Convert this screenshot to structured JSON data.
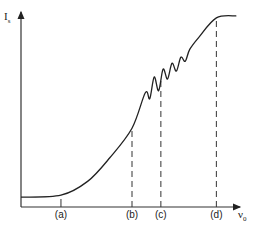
{
  "chart_data": {
    "type": "line",
    "title": "",
    "ylabel": "I",
    "ylabel_subscript": "s",
    "xlabel": "ν",
    "xlabel_subscript": "0",
    "x_markers": [
      {
        "label": "(a)",
        "x": 0.18,
        "dashed": false
      },
      {
        "label": "(b)",
        "x": 0.5,
        "dashed": true
      },
      {
        "label": "(c)",
        "x": 0.63,
        "dashed": true
      },
      {
        "label": "(d)",
        "x": 0.88,
        "dashed": true
      }
    ],
    "curve_description": "Intensity rises slowly from a low baseline, steepens past (b), shows damped oscillations between (b) and (d) beginning near (c), then saturates near (d).",
    "series": [
      {
        "name": "I_s",
        "x": [
          0.0,
          0.18,
          0.3,
          0.4,
          0.5,
          0.56,
          0.58,
          0.6,
          0.62,
          0.64,
          0.66,
          0.68,
          0.7,
          0.72,
          0.74,
          0.76,
          0.8,
          0.88,
          0.97
        ],
        "y": [
          0.05,
          0.06,
          0.13,
          0.25,
          0.4,
          0.58,
          0.55,
          0.66,
          0.59,
          0.7,
          0.65,
          0.73,
          0.69,
          0.76,
          0.74,
          0.8,
          0.86,
          0.96,
          0.97
        ]
      }
    ],
    "xlim": [
      0,
      1
    ],
    "ylim": [
      0,
      1
    ],
    "grid": false,
    "legend": "none"
  }
}
